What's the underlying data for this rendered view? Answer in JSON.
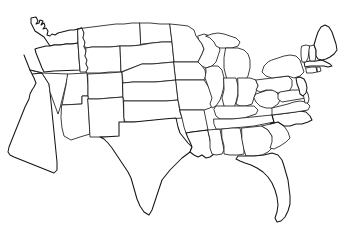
{
  "figure": {
    "kind": "map",
    "title": "United States State Outline Map",
    "width_px": 342,
    "height_px": 236,
    "background_color": "#ffffff",
    "state_border_color": "#1e1e1e",
    "coastline_color": "#151515",
    "fill_color": "#ffffff",
    "state_border_width_px": 0.85,
    "coastline_width_px": 1.05,
    "labels_visible": "none",
    "legend_visible": "none",
    "projection_look": "albers-like conic, northern border curves downward toward the east"
  },
  "map_data": {
    "type": "choropleth-blank",
    "region": "contiguous-united-states",
    "state_count": 49,
    "includes_district_of_columbia": false,
    "excluded_regions": [
      "Alaska",
      "Hawaii",
      "Puerto Rico"
    ],
    "states": [
      {
        "code": "WA",
        "name": "Washington",
        "region": "West"
      },
      {
        "code": "OR",
        "name": "Oregon",
        "region": "West"
      },
      {
        "code": "CA",
        "name": "California",
        "region": "West"
      },
      {
        "code": "NV",
        "name": "Nevada",
        "region": "West"
      },
      {
        "code": "ID",
        "name": "Idaho",
        "region": "West"
      },
      {
        "code": "MT",
        "name": "Montana",
        "region": "West"
      },
      {
        "code": "WY",
        "name": "Wyoming",
        "region": "West"
      },
      {
        "code": "UT",
        "name": "Utah",
        "region": "West"
      },
      {
        "code": "AZ",
        "name": "Arizona",
        "region": "West"
      },
      {
        "code": "CO",
        "name": "Colorado",
        "region": "West"
      },
      {
        "code": "NM",
        "name": "New Mexico",
        "region": "West"
      },
      {
        "code": "ND",
        "name": "North Dakota",
        "region": "Midwest"
      },
      {
        "code": "SD",
        "name": "South Dakota",
        "region": "Midwest"
      },
      {
        "code": "NE",
        "name": "Nebraska",
        "region": "Midwest"
      },
      {
        "code": "KS",
        "name": "Kansas",
        "region": "Midwest"
      },
      {
        "code": "OK",
        "name": "Oklahoma",
        "region": "South"
      },
      {
        "code": "TX",
        "name": "Texas",
        "region": "South"
      },
      {
        "code": "MN",
        "name": "Minnesota",
        "region": "Midwest"
      },
      {
        "code": "IA",
        "name": "Iowa",
        "region": "Midwest"
      },
      {
        "code": "MO",
        "name": "Missouri",
        "region": "Midwest"
      },
      {
        "code": "AR",
        "name": "Arkansas",
        "region": "South"
      },
      {
        "code": "LA",
        "name": "Louisiana",
        "region": "South"
      },
      {
        "code": "WI",
        "name": "Wisconsin",
        "region": "Midwest"
      },
      {
        "code": "IL",
        "name": "Illinois",
        "region": "Midwest"
      },
      {
        "code": "MS",
        "name": "Mississippi",
        "region": "South"
      },
      {
        "code": "MI",
        "name": "Michigan",
        "region": "Midwest"
      },
      {
        "code": "IN",
        "name": "Indiana",
        "region": "Midwest"
      },
      {
        "code": "OH",
        "name": "Ohio",
        "region": "Midwest"
      },
      {
        "code": "KY",
        "name": "Kentucky",
        "region": "South"
      },
      {
        "code": "TN",
        "name": "Tennessee",
        "region": "South"
      },
      {
        "code": "AL",
        "name": "Alabama",
        "region": "South"
      },
      {
        "code": "GA",
        "name": "Georgia",
        "region": "South"
      },
      {
        "code": "FL",
        "name": "Florida",
        "region": "South"
      },
      {
        "code": "SC",
        "name": "South Carolina",
        "region": "South"
      },
      {
        "code": "NC",
        "name": "North Carolina",
        "region": "South"
      },
      {
        "code": "VA",
        "name": "Virginia",
        "region": "South"
      },
      {
        "code": "WV",
        "name": "West Virginia",
        "region": "South"
      },
      {
        "code": "PA",
        "name": "Pennsylvania",
        "region": "Northeast"
      },
      {
        "code": "NY",
        "name": "New York",
        "region": "Northeast"
      },
      {
        "code": "MD",
        "name": "Maryland",
        "region": "South"
      },
      {
        "code": "DE",
        "name": "Delaware",
        "region": "South"
      },
      {
        "code": "NJ",
        "name": "New Jersey",
        "region": "Northeast"
      },
      {
        "code": "CT",
        "name": "Connecticut",
        "region": "Northeast"
      },
      {
        "code": "RI",
        "name": "Rhode Island",
        "region": "Northeast"
      },
      {
        "code": "MA",
        "name": "Massachusetts",
        "region": "Northeast"
      },
      {
        "code": "VT",
        "name": "Vermont",
        "region": "Northeast"
      },
      {
        "code": "NH",
        "name": "New Hampshire",
        "region": "Northeast"
      },
      {
        "code": "ME",
        "name": "Maine",
        "region": "Northeast"
      }
    ]
  }
}
